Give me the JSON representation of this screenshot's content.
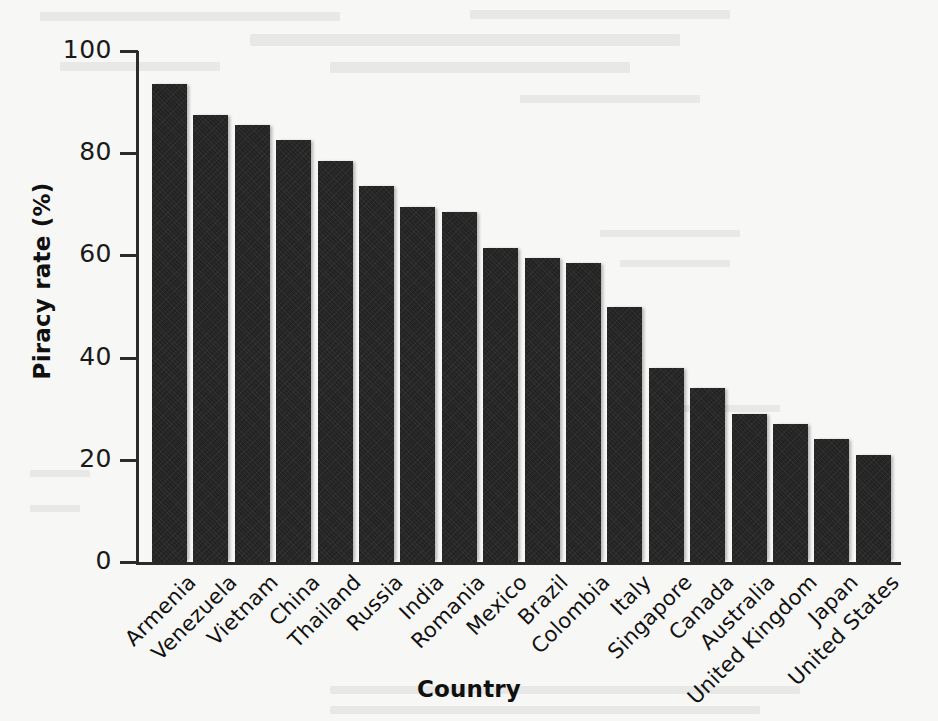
{
  "chart_data": {
    "type": "bar",
    "title": "",
    "xlabel": "Country",
    "ylabel": "Piracy rate (%)",
    "categories": [
      "Armenia",
      "Venezuela",
      "Vietnam",
      "China",
      "Thailand",
      "Russia",
      "India",
      "Romania",
      "Mexico",
      "Brazil",
      "Colombia",
      "Italy",
      "Singapore",
      "Canada",
      "Australia",
      "United Kingdom",
      "Japan",
      "United States"
    ],
    "values": [
      93.5,
      87.5,
      85.5,
      82.5,
      78.5,
      73.5,
      69.5,
      68.5,
      61.5,
      59.5,
      58.5,
      50.0,
      38.0,
      34.0,
      29.0,
      27.0,
      24.0,
      21.0
    ],
    "ylim": [
      0,
      100
    ],
    "yticks": [
      0,
      20,
      40,
      60,
      80,
      100
    ],
    "ytick_labels": [
      "0",
      "20",
      "40",
      "60",
      "80",
      "100"
    ],
    "grid": false,
    "legend": null,
    "bar_color": "#232323",
    "axis_color": "#2b2b2b",
    "background_color": "#f7f7f5",
    "orientation": "vertical",
    "xtick_rotation": -45
  },
  "axes": {
    "y_title": "Piracy rate (%)",
    "x_title": "Country"
  }
}
